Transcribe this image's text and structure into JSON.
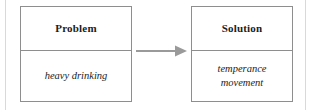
{
  "diagram": {
    "type": "problem-solution-flow",
    "background_color": "#ffffff",
    "border_color": "#8e8e8e",
    "rule_color": "#d9d9d9",
    "arrow_color": "#9a9a9a",
    "text_color": "#1c1c1c",
    "boxes": [
      {
        "id": "problem",
        "header": "Problem",
        "body": "heavy drinking"
      },
      {
        "id": "solution",
        "header": "Solution",
        "body": "temperance\nmovement"
      }
    ],
    "connector": {
      "name": "arrow-right-icon",
      "direction": "right",
      "from": "problem",
      "to": "solution"
    }
  }
}
